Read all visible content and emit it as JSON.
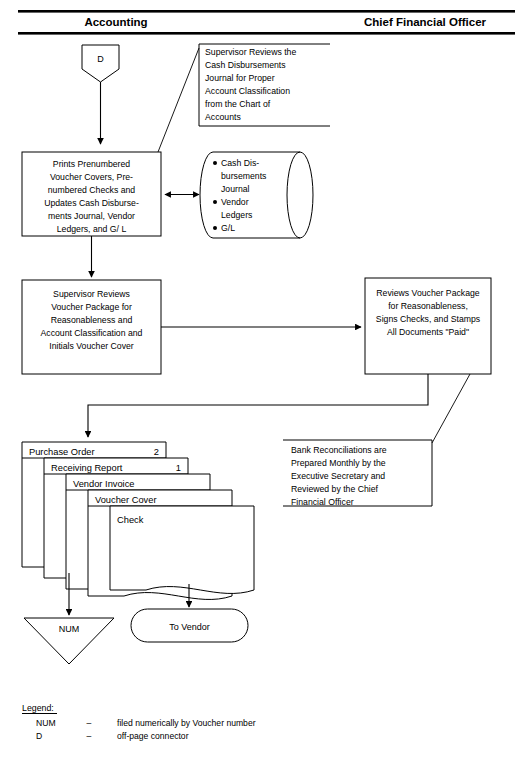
{
  "diagram": {
    "lanes": [
      {
        "id": "accounting",
        "label": "Accounting"
      },
      {
        "id": "cfo",
        "label": "Chief Financial Officer"
      }
    ],
    "offpage_connector": {
      "label": "D"
    },
    "notes": [
      {
        "id": "note-supervisor-review",
        "lines": [
          "Supervisor Reviews the",
          "Cash Disbursements",
          "Journal for Proper",
          "Account Classification",
          "from the Chart of",
          "Accounts"
        ]
      },
      {
        "id": "note-bank-reconciliations",
        "lines": [
          "Bank Reconciliations are",
          "Prepared Monthly by the",
          "Executive Secretary and",
          "Reviewed by the Chief",
          "Financial Officer"
        ]
      }
    ],
    "processes": [
      {
        "id": "process-prints-vouchers",
        "lines": [
          "Prints Prenumbered",
          "Voucher Covers, Pre-",
          "numbered Checks and",
          "Updates Cash Disburse-",
          "ments Journal, Vendor",
          "Ledgers, and G/ L"
        ]
      },
      {
        "id": "process-supervisor-reviews",
        "lines": [
          "Supervisor Reviews",
          "Voucher Package for",
          "Reasonableness and",
          "Account Classification and",
          "Initials Voucher Cover"
        ]
      },
      {
        "id": "process-cfo-reviews",
        "lines": [
          "Reviews Voucher Package",
          "for Reasonableness,",
          "Signs Checks, and Stamps",
          "All Documents \"Paid\""
        ]
      }
    ],
    "datastore": {
      "id": "datastore-journals",
      "items": [
        [
          "Cash Dis-",
          "bursements",
          "Journal"
        ],
        [
          "Vendor",
          "Ledgers"
        ],
        [
          "G/L"
        ]
      ]
    },
    "documents": [
      {
        "id": "doc-purchase-order",
        "label": "Purchase Order",
        "copies": "2"
      },
      {
        "id": "doc-receiving-report",
        "label": "Receiving Report",
        "copies": "1"
      },
      {
        "id": "doc-vendor-invoice",
        "label": "Vendor Invoice",
        "copies": ""
      },
      {
        "id": "doc-voucher-cover",
        "label": "Voucher Cover",
        "copies": ""
      },
      {
        "id": "doc-check",
        "label": "Check",
        "copies": ""
      }
    ],
    "terminators": [
      {
        "id": "file-num",
        "label": "NUM",
        "shape": "triangle"
      },
      {
        "id": "terminator-to-vendor",
        "label": "To Vendor",
        "shape": "rounded"
      }
    ],
    "legend": {
      "heading": "Legend:",
      "dash": "–",
      "entries": [
        {
          "symbol": "NUM",
          "meaning": "filed numerically by Voucher number"
        },
        {
          "symbol": "D",
          "meaning": "off-page connector"
        }
      ]
    },
    "colors": {
      "ink": "#000000",
      "paper": "#ffffff"
    }
  }
}
